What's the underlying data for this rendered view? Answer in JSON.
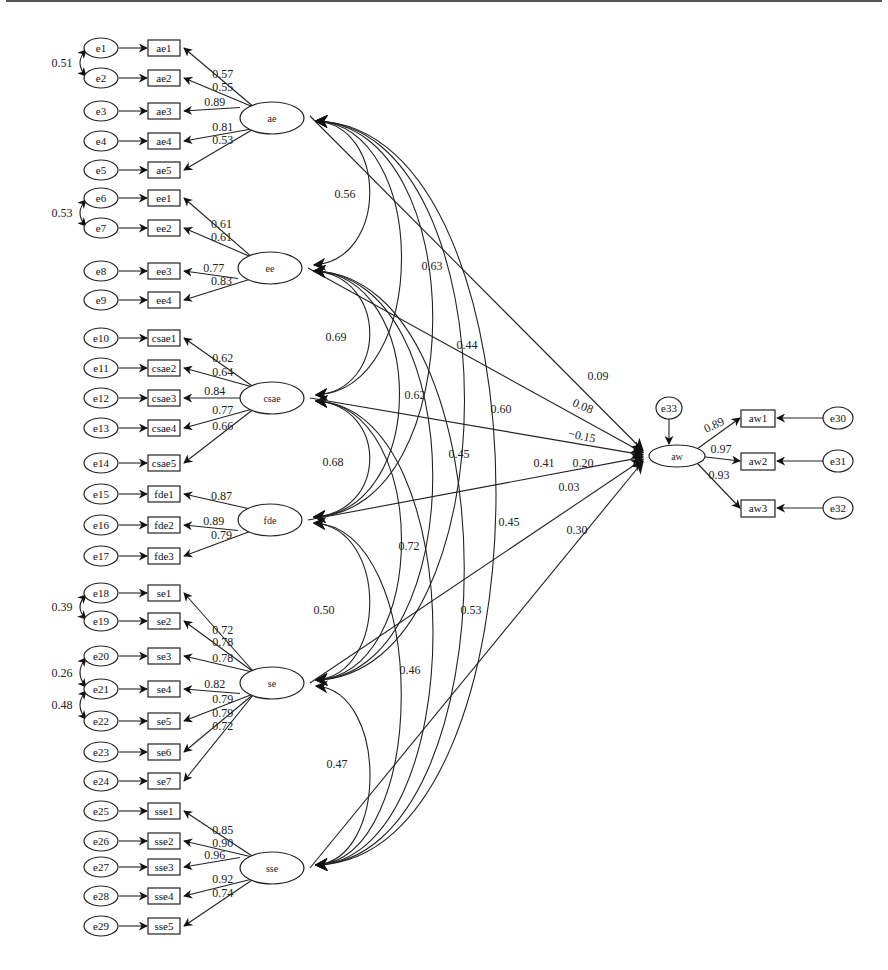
{
  "diagram": {
    "type": "structural-equation-model",
    "latents": [
      {
        "id": "ae",
        "label": "ae",
        "x": 272,
        "y": 118
      },
      {
        "id": "ee",
        "label": "ee",
        "x": 270,
        "y": 268
      },
      {
        "id": "csae",
        "label": "csae",
        "x": 272,
        "y": 398
      },
      {
        "id": "fde",
        "label": "fde",
        "x": 270,
        "y": 520
      },
      {
        "id": "se",
        "label": "se",
        "x": 272,
        "y": 683
      },
      {
        "id": "sse",
        "label": "sse",
        "x": 272,
        "y": 868
      },
      {
        "id": "aw",
        "label": "aw",
        "x": 677,
        "y": 456
      }
    ],
    "indicators": [
      {
        "label": "ae1",
        "error": "e1",
        "y": 48,
        "latent": "ae",
        "loading": "0.57"
      },
      {
        "label": "ae2",
        "error": "e2",
        "y": 78,
        "latent": "ae",
        "loading": "0.55"
      },
      {
        "label": "ae3",
        "error": "e3",
        "y": 111,
        "latent": "ae",
        "loading": "0.89"
      },
      {
        "label": "ae4",
        "error": "e4",
        "y": 141,
        "latent": "ae",
        "loading": "0.81"
      },
      {
        "label": "ae5",
        "error": "e5",
        "y": 170,
        "latent": "ae",
        "loading": "0.53"
      },
      {
        "label": "ee1",
        "error": "e6",
        "y": 198,
        "latent": "ee",
        "loading": "0.61"
      },
      {
        "label": "ee2",
        "error": "e7",
        "y": 228,
        "latent": "ee",
        "loading": "0.61"
      },
      {
        "label": "ee3",
        "error": "e8",
        "y": 271,
        "latent": "ee",
        "loading": "0.77"
      },
      {
        "label": "ee4",
        "error": "e9",
        "y": 300,
        "latent": "ee",
        "loading": "0.83"
      },
      {
        "label": "csae1",
        "error": "e10",
        "y": 338,
        "latent": "csae",
        "loading": "0.62"
      },
      {
        "label": "csae2",
        "error": "e11",
        "y": 368,
        "latent": "csae",
        "loading": "0.64"
      },
      {
        "label": "csae3",
        "error": "e12",
        "y": 398,
        "latent": "csae",
        "loading": "0.84"
      },
      {
        "label": "csae4",
        "error": "e13",
        "y": 428,
        "latent": "csae",
        "loading": "0.77"
      },
      {
        "label": "csae5",
        "error": "e14",
        "y": 463,
        "latent": "csae",
        "loading": "0.66"
      },
      {
        "label": "fde1",
        "error": "e15",
        "y": 494,
        "latent": "fde",
        "loading": "0.87"
      },
      {
        "label": "fde2",
        "error": "e16",
        "y": 525,
        "latent": "fde",
        "loading": "0.89"
      },
      {
        "label": "fde3",
        "error": "e17",
        "y": 556,
        "latent": "fde",
        "loading": "0.79"
      },
      {
        "label": "se1",
        "error": "e18",
        "y": 593,
        "latent": "se",
        "loading": "0.72"
      },
      {
        "label": "se2",
        "error": "e19",
        "y": 621,
        "latent": "se",
        "loading": "0.78"
      },
      {
        "label": "se3",
        "error": "e20",
        "y": 656,
        "latent": "se",
        "loading": "0.78"
      },
      {
        "label": "se4",
        "error": "e21",
        "y": 689,
        "latent": "se",
        "loading": "0.82"
      },
      {
        "label": "se5",
        "error": "e22",
        "y": 721,
        "latent": "se",
        "loading": "0.79"
      },
      {
        "label": "se6",
        "error": "e23",
        "y": 752,
        "latent": "se",
        "loading": "0.79"
      },
      {
        "label": "se7",
        "error": "e24",
        "y": 781,
        "latent": "se",
        "loading": "0.72"
      },
      {
        "label": "sse1",
        "error": "e25",
        "y": 811,
        "latent": "sse",
        "loading": "0.85"
      },
      {
        "label": "sse2",
        "error": "e26",
        "y": 841,
        "latent": "sse",
        "loading": "0.90"
      },
      {
        "label": "sse3",
        "error": "e27",
        "y": 867,
        "latent": "sse",
        "loading": "0.96"
      },
      {
        "label": "sse4",
        "error": "e28",
        "y": 896,
        "latent": "sse",
        "loading": "0.92"
      },
      {
        "label": "sse5",
        "error": "e29",
        "y": 926,
        "latent": "sse",
        "loading": "0.74"
      }
    ],
    "error_covariances": [
      {
        "between": [
          "e1",
          "e2"
        ],
        "value": "0.51",
        "y1": 48,
        "y2": 78
      },
      {
        "between": [
          "e6",
          "e7"
        ],
        "value": "0.53",
        "y1": 198,
        "y2": 228
      },
      {
        "between": [
          "e18",
          "e19"
        ],
        "value": "0.39",
        "y1": 593,
        "y2": 621
      },
      {
        "between": [
          "e20",
          "e21"
        ],
        "value": "0.26",
        "y1": 656,
        "y2": 689
      },
      {
        "between": [
          "e21",
          "e22"
        ],
        "value": "0.48",
        "y1": 689,
        "y2": 721
      }
    ],
    "outcome_indicators": [
      {
        "label": "aw1",
        "error": "e30",
        "y": 418,
        "loading": "0.89"
      },
      {
        "label": "aw2",
        "error": "e31",
        "y": 461,
        "loading": "0.97"
      },
      {
        "label": "aw3",
        "error": "e32",
        "y": 508,
        "loading": "0.93"
      }
    ],
    "outcome_error": {
      "label": "e33"
    },
    "latent_correlations": [
      {
        "between": [
          "ae",
          "ee"
        ],
        "value": "0.56"
      },
      {
        "between": [
          "ae",
          "csae"
        ],
        "value": "0.63"
      },
      {
        "between": [
          "ae",
          "fde"
        ],
        "value": "0.44"
      },
      {
        "between": [
          "ae",
          "se"
        ],
        "value": "0.60"
      },
      {
        "between": [
          "ae",
          "sse"
        ],
        "value": "0.41"
      },
      {
        "between": [
          "ee",
          "csae"
        ],
        "value": "0.69"
      },
      {
        "between": [
          "ee",
          "fde"
        ],
        "value": "0.62"
      },
      {
        "between": [
          "ee",
          "se"
        ],
        "value": "0.45"
      },
      {
        "between": [
          "ee",
          "sse"
        ],
        "value": "0.45"
      },
      {
        "between": [
          "csae",
          "fde"
        ],
        "value": "0.68"
      },
      {
        "between": [
          "csae",
          "se"
        ],
        "value": "0.72"
      },
      {
        "between": [
          "csae",
          "sse"
        ],
        "value": "0.53"
      },
      {
        "between": [
          "fde",
          "se"
        ],
        "value": "0.50"
      },
      {
        "between": [
          "fde",
          "sse"
        ],
        "value": "0.46"
      },
      {
        "between": [
          "se",
          "sse"
        ],
        "value": "0.47"
      }
    ],
    "structural_paths": [
      {
        "from": "ae",
        "to": "aw",
        "value": "0.09"
      },
      {
        "from": "ee",
        "to": "aw",
        "value": "0.08"
      },
      {
        "from": "csae",
        "to": "aw",
        "value": "-0.15"
      },
      {
        "from": "fde",
        "to": "aw",
        "value": "0.20"
      },
      {
        "from": "se",
        "to": "aw",
        "value": "0.03"
      },
      {
        "from": "sse",
        "to": "aw",
        "value": "0.30"
      }
    ]
  },
  "labels": {
    "corr_positions": [
      {
        "text": "0.56",
        "x": 345,
        "y": 194
      },
      {
        "text": "0.63",
        "x": 432,
        "y": 266
      },
      {
        "text": "0.69",
        "x": 336,
        "y": 337
      },
      {
        "text": "0.44",
        "x": 467,
        "y": 345
      },
      {
        "text": "0.62",
        "x": 415,
        "y": 395
      },
      {
        "text": "0.60",
        "x": 501,
        "y": 409
      },
      {
        "text": "0.68",
        "x": 333,
        "y": 462
      },
      {
        "text": "0.45",
        "x": 459,
        "y": 454
      },
      {
        "text": "0.41",
        "x": 544,
        "y": 463
      },
      {
        "text": "0.72",
        "x": 409,
        "y": 546
      },
      {
        "text": "0.45",
        "x": 509,
        "y": 522
      },
      {
        "text": "0.50",
        "x": 324,
        "y": 610
      },
      {
        "text": "0.53",
        "x": 471,
        "y": 610
      },
      {
        "text": "0.46",
        "x": 410,
        "y": 670
      },
      {
        "text": "0.47",
        "x": 337,
        "y": 764
      }
    ],
    "path_positions": [
      {
        "text": "0.09",
        "x": 598,
        "y": 376,
        "rot": 0
      },
      {
        "text": "0.08",
        "x": 583,
        "y": 406,
        "rot": 22
      },
      {
        "text": "−0.15",
        "x": 582,
        "y": 436,
        "rot": 12
      },
      {
        "text": "0.20",
        "x": 583,
        "y": 463,
        "rot": 0
      },
      {
        "text": "0.03",
        "x": 569,
        "y": 487,
        "rot": 0
      },
      {
        "text": "0.30",
        "x": 577,
        "y": 530,
        "rot": 0
      }
    ]
  }
}
